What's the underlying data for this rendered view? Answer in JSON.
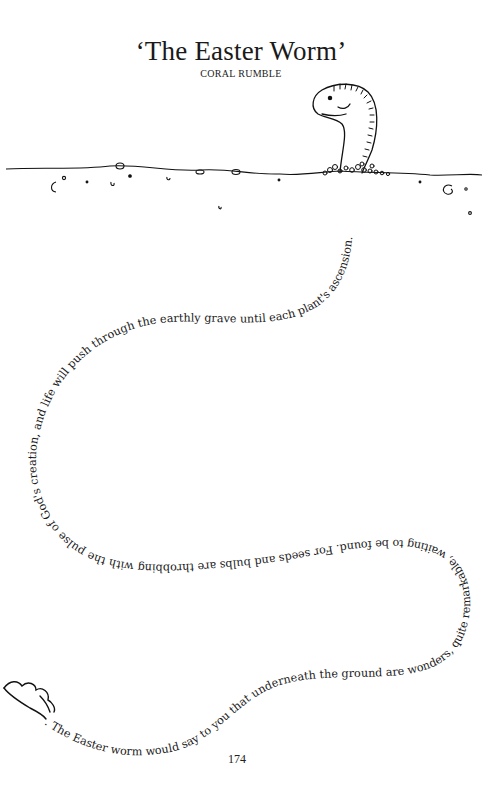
{
  "page": {
    "title": "‘The Easter Worm’",
    "author": "CORAL RUMBLE",
    "page_number": "174"
  },
  "poem": {
    "text": ". The Easter worm would say to you that underneath the ground are wonders, quite remarkable, waiting to be found. For seeds and bulbs are throbbing with the pulse of God's creation, and life will push through the earthly grave until each plant's ascension."
  },
  "illustration": {
    "worm_head": "worm-peeking-from-ground",
    "worm_tail": "worm-tail-end",
    "ground": "ground-line-with-pebbles"
  }
}
